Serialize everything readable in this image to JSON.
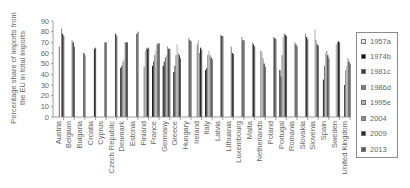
{
  "chart_data": {
    "type": "bar",
    "title": "",
    "xlabel": "",
    "ylabel": "Percentage share of imports from the EU in total imports",
    "ylim": [
      0,
      90
    ],
    "yticks": [
      0,
      10,
      20,
      30,
      40,
      50,
      60,
      70,
      80,
      90
    ],
    "grid": false,
    "legend_position": "right",
    "categories": [
      "Austria",
      "Belgium",
      "Bulgaria",
      "Croatia",
      "Cyprus",
      "Czech Republic",
      "Denmark",
      "Estonia",
      "Finland",
      "France",
      "Germany",
      "Greece",
      "Hungary",
      "Ireland",
      "Italy",
      "Latvia",
      "Lithuania",
      "Luxembourg",
      "Malta",
      "Netherlands",
      "Poland",
      "Portugal",
      "Romania",
      "Slovakia",
      "Slovenia",
      "Spain",
      "Sweden",
      "United Kingdom"
    ],
    "series": [
      {
        "name": "1957a",
        "color": "#e6e6e6",
        "values": [
          null,
          null,
          null,
          null,
          null,
          null,
          null,
          null,
          null,
          null,
          null,
          null,
          null,
          null,
          null,
          null,
          null,
          null,
          null,
          null,
          null,
          null,
          null,
          null,
          null,
          null,
          null,
          null
        ]
      },
      {
        "name": "1974b",
        "color": "#111111",
        "values": [
          null,
          null,
          null,
          null,
          null,
          null,
          46,
          null,
          null,
          48,
          48,
          42,
          null,
          null,
          44,
          null,
          null,
          null,
          null,
          null,
          null,
          44,
          null,
          null,
          null,
          null,
          null,
          null
        ]
      },
      {
        "name": "1981c",
        "color": "#3a3a3a",
        "values": [
          null,
          null,
          null,
          null,
          null,
          null,
          48,
          null,
          null,
          52,
          52,
          48,
          null,
          null,
          46,
          null,
          null,
          null,
          null,
          null,
          null,
          38,
          null,
          null,
          null,
          35,
          null,
          30
        ]
      },
      {
        "name": "1986d",
        "color": "#7a7a7a",
        "values": [
          66,
          null,
          null,
          null,
          null,
          null,
          52,
          null,
          47,
          58,
          56,
          58,
          null,
          68,
          58,
          null,
          null,
          null,
          null,
          62,
          null,
          58,
          null,
          null,
          null,
          48,
          null,
          44
        ]
      },
      {
        "name": "1995e",
        "color": "#b5b5b5",
        "values": [
          null,
          null,
          null,
          null,
          null,
          null,
          54,
          null,
          62,
          62,
          58,
          68,
          null,
          72,
          62,
          null,
          null,
          null,
          null,
          60,
          null,
          75,
          null,
          null,
          82,
          60,
          68,
          48
        ]
      },
      {
        "name": "2004",
        "color": "#8c8c8c",
        "values": [
          83,
          72,
          null,
          null,
          null,
          null,
          70,
          null,
          65,
          68,
          66,
          60,
          74,
          60,
          58,
          77,
          66,
          75,
          70,
          55,
          75,
          78,
          70,
          78,
          72,
          62,
          70,
          55
        ]
      },
      {
        "name": "2009",
        "color": "#2a2a2a",
        "values": [
          78,
          70,
          60,
          64,
          70,
          78,
          70,
          78,
          64,
          69,
          64,
          58,
          72,
          65,
          56,
          76,
          60,
          72,
          68,
          50,
          74,
          77,
          68,
          75,
          68,
          58,
          71,
          52
        ]
      },
      {
        "name": "2013",
        "color": "#5c5c5c",
        "values": [
          76,
          66,
          58,
          65,
          70,
          76,
          70,
          80,
          65,
          69,
          64,
          55,
          71,
          63,
          54,
          76,
          59,
          72,
          66,
          47,
          73,
          76,
          66,
          73,
          67,
          55,
          70,
          50
        ]
      }
    ]
  },
  "legend": {
    "items": [
      {
        "label": "1957a",
        "color": "#e6e6e6"
      },
      {
        "label": "1974b",
        "color": "#111111"
      },
      {
        "label": "1981c",
        "color": "#3a3a3a"
      },
      {
        "label": "1986d",
        "color": "#7a7a7a"
      },
      {
        "label": "1995e",
        "color": "#b5b5b5"
      },
      {
        "label": "2004",
        "color": "#8c8c8c"
      },
      {
        "label": "2009",
        "color": "#2a2a2a"
      },
      {
        "label": "2013",
        "color": "#5c5c5c"
      }
    ]
  }
}
